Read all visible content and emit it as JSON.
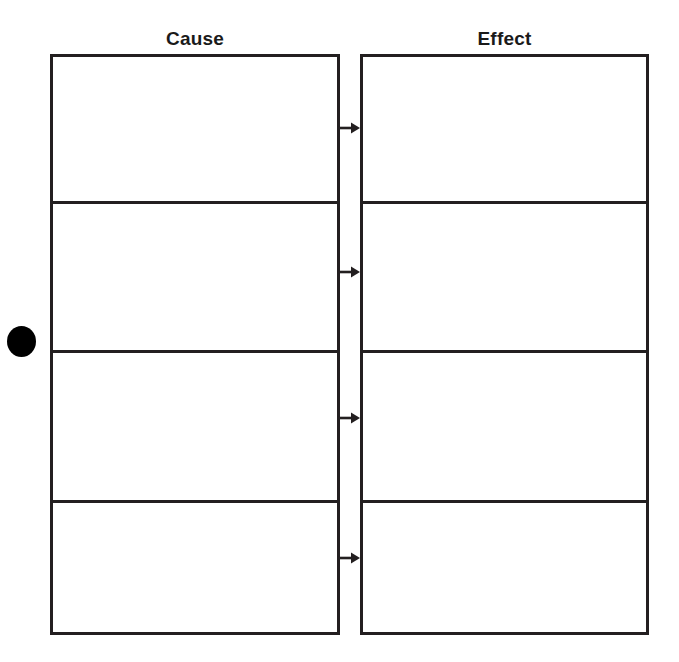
{
  "page": {
    "background_color": "#ffffff",
    "line_color": "#231f20",
    "text_color": "#1a1a1a",
    "width": 679,
    "height": 662
  },
  "columns": [
    {
      "id": "cause",
      "heading": "Cause",
      "cells": [
        {
          "value": ""
        },
        {
          "value": ""
        },
        {
          "value": ""
        },
        {
          "value": ""
        }
      ]
    },
    {
      "id": "effect",
      "heading": "Effect",
      "cells": [
        {
          "value": ""
        },
        {
          "value": ""
        },
        {
          "value": ""
        },
        {
          "value": ""
        }
      ]
    }
  ],
  "connectors": [
    {
      "id": "arrow-1",
      "icon": "arrow-right-icon",
      "from": "cause-cell-1",
      "to": "effect-cell-1"
    },
    {
      "id": "arrow-2",
      "icon": "arrow-right-icon",
      "from": "cause-cell-2",
      "to": "effect-cell-2"
    },
    {
      "id": "arrow-3",
      "icon": "arrow-right-icon",
      "from": "cause-cell-3",
      "to": "effect-cell-3"
    },
    {
      "id": "arrow-4",
      "icon": "arrow-right-icon",
      "from": "cause-cell-4",
      "to": "effect-cell-4"
    }
  ],
  "marker": {
    "icon": "filled-circle-bullet-icon",
    "color": "#000000"
  }
}
